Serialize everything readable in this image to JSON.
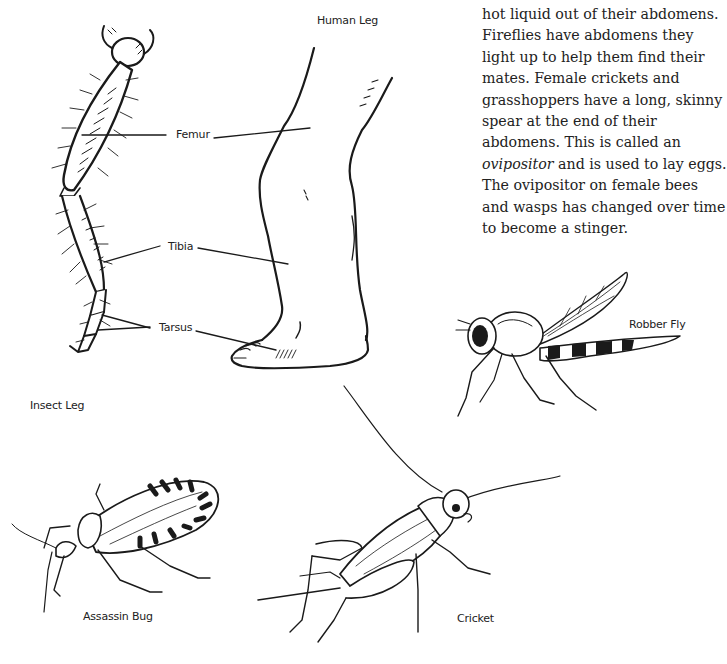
{
  "text_column": {
    "lines": [
      "hot liquid out of their abdomens.",
      "Fireflies have abdomens they",
      "light up to help them find their",
      "mates. Female crickets and",
      "grasshoppers have a long, skinny",
      "spear at the end of their",
      "abdomens. This is called an",
      "ovipositor",
      " and is used to lay eggs.",
      "The ovipositor on female bees",
      "and wasps has changed over time",
      "to become a stinger."
    ],
    "italic_term": "ovipositor"
  },
  "leg_diagram": {
    "human_leg_caption": "Human Leg",
    "insect_leg_caption": "Insect Leg",
    "parts": [
      {
        "label": "Femur"
      },
      {
        "label": "Tibia"
      },
      {
        "label": "Tarsus"
      }
    ]
  },
  "illustrations": [
    {
      "caption": "Robber Fly"
    },
    {
      "caption": "Assassin Bug"
    },
    {
      "caption": "Cricket"
    }
  ],
  "colors": {
    "ink": "#1a1a1a",
    "paper": "#ffffff"
  }
}
